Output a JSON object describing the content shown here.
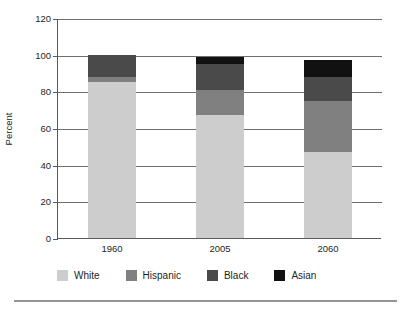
{
  "chart_data": {
    "type": "bar",
    "subtype": "stacked-bar",
    "title": "",
    "xlabel": "",
    "ylabel": "Percent",
    "categories": [
      "1960",
      "2005",
      "2060"
    ],
    "ylim": [
      0,
      120
    ],
    "yticks": [
      0,
      20,
      40,
      60,
      80,
      100,
      120
    ],
    "ytick_labels": [
      "0",
      "20",
      "40",
      "60",
      "80",
      "100",
      "120"
    ],
    "grid": true,
    "legend_position": "bottom",
    "series": [
      {
        "name": "White",
        "color": "#cdcdcd",
        "values": [
          85,
          67,
          47
        ]
      },
      {
        "name": "Hispanic",
        "color": "#808080",
        "values": [
          3,
          14,
          28
        ]
      },
      {
        "name": "Black",
        "color": "#4a4a4a",
        "values": [
          12,
          14,
          13
        ]
      },
      {
        "name": "Asian",
        "color": "#111111",
        "values": [
          0,
          4,
          9
        ]
      }
    ],
    "stack_totals": [
      100,
      99,
      97
    ]
  },
  "legend": {
    "items": [
      {
        "label": "White",
        "color": "#cdcdcd"
      },
      {
        "label": "Hispanic",
        "color": "#808080"
      },
      {
        "label": "Black",
        "color": "#4a4a4a"
      },
      {
        "label": "Asian",
        "color": "#111111"
      }
    ]
  }
}
